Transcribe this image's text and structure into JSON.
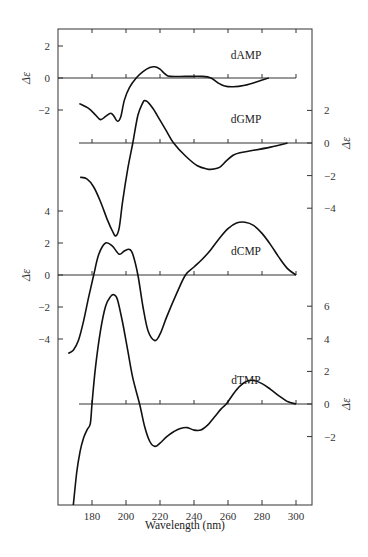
{
  "chart_data": {
    "type": "line",
    "title": "",
    "xlabel": "Wavelength (nm)",
    "xlim": [
      160,
      310
    ],
    "xticks": [
      180,
      200,
      220,
      240,
      260,
      280,
      300
    ],
    "ylabel": "Δε",
    "grid": false,
    "series": [
      {
        "name": "dAMP",
        "axis_side": "left",
        "ylim_shown": [
          -2,
          2
        ],
        "yticks": [
          2,
          0,
          -2
        ],
        "x": [
          172.5,
          178,
          182,
          185,
          188,
          191,
          193,
          195,
          197,
          199,
          202,
          206,
          210,
          214,
          217,
          220,
          223,
          226,
          235,
          245,
          250,
          254,
          258,
          263,
          270,
          278,
          284
        ],
        "y": [
          -1.6,
          -1.9,
          -2.3,
          -2.6,
          -2.4,
          -2.2,
          -2.4,
          -2.7,
          -2.4,
          -1.4,
          -0.6,
          0.0,
          0.4,
          0.65,
          0.7,
          0.55,
          0.25,
          0.1,
          0.1,
          0.1,
          0.0,
          -0.3,
          -0.5,
          -0.55,
          -0.45,
          -0.2,
          0.0
        ]
      },
      {
        "name": "dGMP",
        "axis_side": "right",
        "ylim_shown": [
          -4,
          2
        ],
        "yticks": [
          2,
          0,
          -2,
          -4
        ],
        "x": [
          173,
          177,
          181,
          185,
          189,
          192,
          194,
          196,
          198,
          201,
          204,
          207,
          210,
          211,
          213,
          216,
          220,
          224,
          228,
          235,
          242,
          248,
          251,
          255,
          259,
          263,
          267,
          275,
          285,
          295
        ],
        "y": [
          -2.1,
          -2.2,
          -2.7,
          -3.6,
          -4.7,
          -5.4,
          -5.7,
          -5.2,
          -3.6,
          -1.6,
          0.0,
          1.7,
          2.5,
          2.6,
          2.5,
          2.1,
          1.4,
          0.7,
          0.0,
          -0.8,
          -1.4,
          -1.6,
          -1.6,
          -1.5,
          -1.1,
          -0.75,
          -0.6,
          -0.45,
          -0.25,
          0.0
        ]
      },
      {
        "name": "dCMP",
        "axis_side": "left",
        "ylim_shown": [
          -4,
          4
        ],
        "yticks": [
          4,
          2,
          0,
          -2,
          -4
        ],
        "x": [
          166,
          169,
          172,
          175,
          178,
          181,
          184,
          188,
          192,
          196,
          199,
          202,
          204,
          207,
          210,
          213,
          217,
          220,
          224,
          230,
          235,
          240,
          245,
          250,
          255,
          260,
          265,
          270,
          275,
          280,
          285,
          290,
          295,
          300
        ],
        "y": [
          -4.9,
          -4.7,
          -4.1,
          -2.9,
          -1.4,
          0.0,
          1.3,
          2.0,
          1.8,
          1.3,
          1.5,
          1.6,
          1.3,
          0.0,
          -2.0,
          -3.5,
          -4.1,
          -3.7,
          -2.6,
          -1.1,
          0.0,
          0.5,
          1.0,
          1.6,
          2.3,
          2.9,
          3.25,
          3.3,
          3.1,
          2.6,
          1.9,
          1.1,
          0.4,
          0.0
        ]
      },
      {
        "name": "dTMP",
        "axis_side": "right",
        "ylim_shown": [
          -2,
          6
        ],
        "yticks": [
          6,
          4,
          2,
          0,
          -2
        ],
        "x": [
          169,
          171,
          173,
          175,
          177,
          179,
          180,
          182,
          185,
          188,
          191,
          193,
          195,
          198,
          201,
          204,
          208,
          211,
          214,
          217,
          220,
          224,
          228,
          232,
          236,
          240,
          244,
          248,
          252,
          256,
          259,
          263,
          267,
          271,
          275,
          280,
          285,
          290,
          295,
          300
        ],
        "y": [
          -6.2,
          -4.2,
          -2.9,
          -2.1,
          -1.6,
          -1.2,
          0.0,
          2.2,
          4.5,
          6.0,
          6.6,
          6.7,
          6.4,
          5.0,
          3.3,
          1.6,
          0.0,
          -1.4,
          -2.3,
          -2.6,
          -2.4,
          -2.0,
          -1.7,
          -1.5,
          -1.45,
          -1.6,
          -1.6,
          -1.3,
          -0.8,
          -0.3,
          0.0,
          0.6,
          1.1,
          1.4,
          1.45,
          1.25,
          0.9,
          0.5,
          0.15,
          0.0
        ]
      }
    ]
  }
}
